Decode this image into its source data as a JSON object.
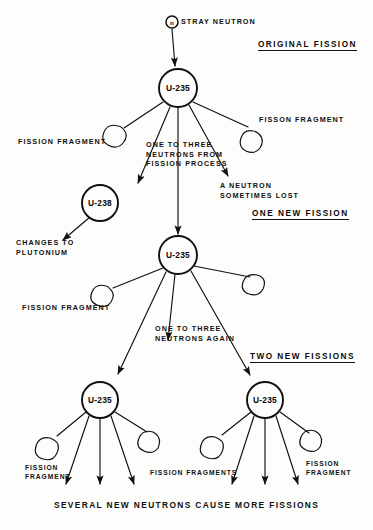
{
  "diagram": {
    "background_color": "#fdfdfb",
    "ink_color": "#101010"
  },
  "section_headings": [
    {
      "id": "original-fission",
      "label": "ORIGINAL FISSION",
      "x": 258,
      "y": 46
    },
    {
      "id": "one-new-fission",
      "label": "ONE NEW FISSION",
      "x": 252,
      "y": 215
    },
    {
      "id": "two-new-fissions",
      "label": "TWO NEW FISSIONS",
      "x": 250,
      "y": 358
    }
  ],
  "nuclei": [
    {
      "id": "u235-top",
      "label": "U-235",
      "x": 178,
      "y": 88,
      "r": 19
    },
    {
      "id": "u238-left",
      "label": "U-238",
      "x": 100,
      "y": 203,
      "r": 18
    },
    {
      "id": "u235-second",
      "label": "U-235",
      "x": 178,
      "y": 255,
      "r": 19
    },
    {
      "id": "u235-bottom-left",
      "label": "U-235",
      "x": 100,
      "y": 400,
      "r": 18
    },
    {
      "id": "u235-bottom-right",
      "label": "U-235",
      "x": 265,
      "y": 400,
      "r": 18
    }
  ],
  "stray_neutron": {
    "label": "STRAY NEUTRON",
    "symbol": "n",
    "x": 172,
    "y": 22,
    "r": 6
  },
  "labels": [
    {
      "id": "fission-fragment-top-left",
      "text": "FISSION FRAGMENT",
      "x": 18,
      "y": 141
    },
    {
      "id": "fisson-fragment-top-right",
      "text": "FISSON FRAGMENT",
      "x": 259,
      "y": 119
    },
    {
      "id": "one-to-three-neutrons",
      "text": "ONE TO THREE\nNEUTRONS FROM\nFISSION PROCESS",
      "x": 146,
      "y": 145
    },
    {
      "id": "a-neutron-sometimes-lost",
      "text": "A NEUTRON\nSOMETIMES LOST",
      "x": 220,
      "y": 186
    },
    {
      "id": "changes-to-plutonium",
      "text": "CHANGES TO\nPLUTONIUM",
      "x": 16,
      "y": 243
    },
    {
      "id": "fission-fragment-mid-left",
      "text": "FISSION FRAGMENT",
      "x": 22,
      "y": 307
    },
    {
      "id": "one-to-three-neutrons-again",
      "text": "ONE TO THREE\nNEUTRONS AGAIN",
      "x": 155,
      "y": 329
    },
    {
      "id": "fission-fragment-bottom-left",
      "text": "FISSION\nFRAGMENT",
      "x": 25,
      "y": 470
    },
    {
      "id": "fission-fragments-center",
      "text": "FISSION FRAGMENTS",
      "x": 150,
      "y": 474
    },
    {
      "id": "fission-fragment-bottom-right",
      "text": "FISSION\nFRAGMENT",
      "x": 306,
      "y": 466
    }
  ],
  "caption": {
    "text": "SEVERAL NEW NEUTRONS CAUSE MORE FISSIONS",
    "x": 54,
    "y": 505
  }
}
